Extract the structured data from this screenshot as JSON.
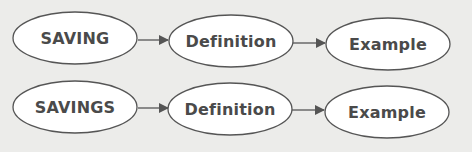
{
  "colors": {
    "background": "#ececea",
    "node_fill": "#ffffff",
    "node_stroke": "#555555",
    "arrow": "#555555",
    "text": "#4a4a4a"
  },
  "rows": [
    {
      "nodes": [
        {
          "label": "SAVING"
        },
        {
          "label": "Definition"
        },
        {
          "label": "Example"
        }
      ]
    },
    {
      "nodes": [
        {
          "label": "SAVINGS"
        },
        {
          "label": "Definition"
        },
        {
          "label": "Example"
        }
      ]
    }
  ],
  "edges": [
    {
      "from": "SAVING",
      "to": "Definition",
      "row": 0
    },
    {
      "from": "Definition",
      "to": "Example",
      "row": 0
    },
    {
      "from": "SAVINGS",
      "to": "Definition",
      "row": 1
    },
    {
      "from": "Definition",
      "to": "Example",
      "row": 1
    }
  ]
}
